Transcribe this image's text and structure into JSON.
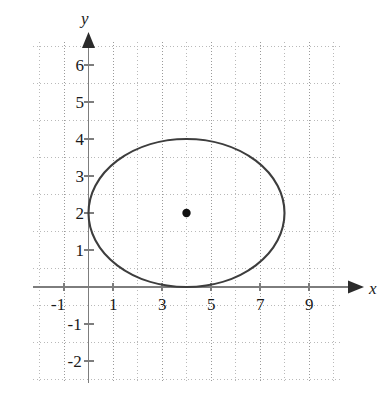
{
  "chart_data": {
    "type": "scatter",
    "title": "",
    "subtitle": "",
    "xlabel": "x",
    "ylabel": "y",
    "xlim": [
      -1.9,
      10.4
    ],
    "ylim": [
      -2.6,
      6.6
    ],
    "xticks": [
      -1,
      1,
      3,
      5,
      7,
      9
    ],
    "yticks": [
      6,
      5,
      4,
      3,
      2,
      1,
      -1,
      -2
    ],
    "xtick_labels": [
      "-1",
      "1",
      "3",
      "5",
      "7",
      "9"
    ],
    "ytick_labels": [
      "6",
      "5",
      "4",
      "3",
      "2",
      "1",
      "-1",
      "-2"
    ],
    "grid": true,
    "grid_style": "dotted-minor-with-solid-major",
    "grid_minor_step": 0.5,
    "legend": "none",
    "series": [
      {
        "name": "ellipse",
        "type": "ellipse",
        "center": [
          4,
          2
        ],
        "semi_axis_x": 4,
        "semi_axis_y": 2,
        "x_intercepts": [
          0,
          8
        ],
        "y_extremes": [
          0,
          4
        ],
        "stroke": "#3d3d3d",
        "fill": "none"
      },
      {
        "name": "center-point",
        "type": "point",
        "points": [
          [
            4,
            2
          ]
        ],
        "marker": "filled-circle",
        "color": "#111111"
      }
    ],
    "annotations": [
      {
        "name": "x-axis-arrow",
        "at": [
          10.2,
          0
        ],
        "direction": "right"
      },
      {
        "name": "y-axis-arrow",
        "at": [
          0,
          6.5
        ],
        "direction": "up"
      }
    ],
    "colors": {
      "curve": "#3d3d3d",
      "point": "#111111",
      "axis": "#7d7d7d",
      "grid_major": "#9a9a9a",
      "grid_minor": "#b9b9b9",
      "text": "#1a1a1a",
      "background": "#ffffff"
    }
  },
  "axes": {
    "x_label": "x",
    "y_label": "y"
  },
  "x_ticks": [
    {
      "value": -1,
      "label": "-1"
    },
    {
      "value": 1,
      "label": "1"
    },
    {
      "value": 3,
      "label": "3"
    },
    {
      "value": 5,
      "label": "5"
    },
    {
      "value": 7,
      "label": "7"
    },
    {
      "value": 9,
      "label": "9"
    }
  ],
  "y_ticks": [
    {
      "value": 6,
      "label": "6"
    },
    {
      "value": 5,
      "label": "5"
    },
    {
      "value": 4,
      "label": "4"
    },
    {
      "value": 3,
      "label": "3"
    },
    {
      "value": 2,
      "label": "2"
    },
    {
      "value": 1,
      "label": "1"
    },
    {
      "value": -1,
      "label": "-1"
    },
    {
      "value": -2,
      "label": "-2"
    }
  ]
}
